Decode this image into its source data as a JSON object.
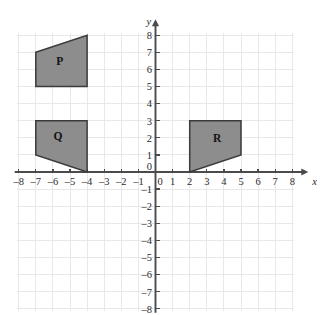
{
  "figure": {
    "title": "",
    "background_color": "#ffffff"
  },
  "chart_data": {
    "type": "scatter",
    "title": "",
    "subtitle": "",
    "xlabel": "x",
    "ylabel": "y",
    "xlim": [
      -8,
      8
    ],
    "ylim": [
      -8,
      8
    ],
    "grid": true,
    "grid_spacing": 1,
    "grid_color": "#e6e6e6",
    "axis_color": "#4b4b4b",
    "legend": "none",
    "x_ticks": [
      -8,
      -7,
      -6,
      -5,
      -4,
      -3,
      -2,
      -1,
      0,
      1,
      2,
      3,
      4,
      5,
      6,
      7,
      8
    ],
    "y_ticks": [
      -8,
      -7,
      -6,
      -5,
      -4,
      -3,
      -2,
      -1,
      0,
      1,
      2,
      3,
      4,
      5,
      6,
      7,
      8
    ],
    "x_tick_labels": [
      "-8",
      "-7",
      "-6",
      "-5",
      "-4",
      "-3",
      "-2",
      "-1",
      "0",
      "1",
      "2",
      "3",
      "4",
      "5",
      "6",
      "7",
      "8"
    ],
    "y_tick_labels": [
      "-8",
      "-7",
      "-6",
      "-5",
      "-4",
      "-3",
      "-2",
      "-1",
      "",
      "1",
      "2",
      "3",
      "4",
      "5",
      "6",
      "7",
      "8"
    ],
    "origin_label": "0",
    "shapes": [
      {
        "name": "P",
        "label": "P",
        "kind": "quadrilateral",
        "fill": "#8d8d8d",
        "stroke": "#3b3b3b",
        "vertices": [
          [
            -7,
            7
          ],
          [
            -4,
            8
          ],
          [
            -4,
            5
          ],
          [
            -7,
            5
          ]
        ],
        "label_position": [
          -5.6,
          6.4
        ]
      },
      {
        "name": "Q",
        "label": "Q",
        "kind": "quadrilateral",
        "fill": "#8d8d8d",
        "stroke": "#3b3b3b",
        "vertices": [
          [
            -7,
            3
          ],
          [
            -4,
            3
          ],
          [
            -4,
            0
          ],
          [
            -7,
            1
          ]
        ],
        "label_position": [
          -5.7,
          2.0
        ]
      },
      {
        "name": "R",
        "label": "R",
        "kind": "quadrilateral",
        "fill": "#8d8d8d",
        "stroke": "#3b3b3b",
        "vertices": [
          [
            2,
            3
          ],
          [
            5,
            3
          ],
          [
            5,
            1
          ],
          [
            2,
            0
          ]
        ],
        "label_position": [
          3.6,
          1.9
        ]
      }
    ]
  }
}
